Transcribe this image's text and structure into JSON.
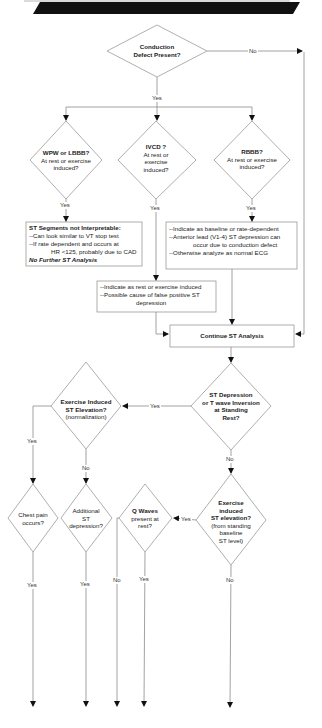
{
  "header_bar": {
    "color": "#111111"
  },
  "colors": {
    "line": "#8a8a8a",
    "arrow": "#111111",
    "shape_stroke": "#9a9a9a",
    "text": "#222222"
  },
  "nodes": {
    "conduction_defect": {
      "lines": [
        "Conduction",
        "Defect  Present?"
      ],
      "bold": true
    },
    "wpw_lbbb": {
      "title": "WPW or LBBB?",
      "sub": [
        "At rest or exercise",
        "induced?"
      ]
    },
    "ivcd": {
      "title": "IVCD ?",
      "sub": [
        "At rest or",
        "exercise",
        "induced?"
      ]
    },
    "rbbb": {
      "title": "RBBB?",
      "sub": [
        "At rest or exercise",
        "induced?"
      ]
    },
    "st_not_interpretable": {
      "title": "ST Segments not Interpretable:",
      "lines": [
        "--Can look similar to VT stop test",
        "--If rate dependent and occurs at"
      ],
      "indent_line": "HR <125, probably due to CAD",
      "footer": "No Further ST Analysis"
    },
    "rbbb_box": {
      "lines": [
        "--Indicate as baseline or rate-dependent",
        "--Anterior lead (V1-4) ST depression can"
      ],
      "indent_line": "occur due to conduction defect",
      "last_line": "--Otherwise analyze as normal ECG"
    },
    "ivcd_box": {
      "lines": [
        "--Indicate as rest or exercise induced",
        "--Possible cause of false positive ST"
      ],
      "indent_line": "depression"
    },
    "continue": {
      "label": "Continue ST Analysis"
    },
    "st_depression": {
      "lines": [
        "ST  Depression",
        "or T wave Inversion",
        "at Standing",
        "Rest?"
      ]
    },
    "exercise_st_elevation": {
      "title": [
        "Exercise Induced",
        "ST Elevation?"
      ],
      "sub": "(normalization)"
    },
    "chest_pain": {
      "lines": [
        "Chest pain",
        "occurs?"
      ]
    },
    "additional_st": {
      "lines": [
        "Additional",
        "ST",
        "depression?"
      ]
    },
    "q_waves": {
      "title": "Q Waves",
      "sub": [
        "present at",
        "rest?"
      ]
    },
    "exercise_from_standing": {
      "title": [
        "Exercise",
        "induced",
        "ST elevation?"
      ],
      "sub": [
        "(from standing",
        "baseline",
        "ST level)"
      ]
    }
  },
  "edge_labels": {
    "conduction_no": "No",
    "conduction_yes": "Yes",
    "wpw_yes": "Yes",
    "ivcd_yes": "Yes",
    "rbbb_yes": "Yes",
    "st_depression_yes": "Yes",
    "st_depression_no": "No",
    "elevation_yes": "Yes",
    "elevation_no": "No",
    "chest_pain_yes": "Yes",
    "additional_yes": "Yes",
    "q_waves_no": "No",
    "q_waves_yes": "Yes",
    "from_standing_yes": "Yes",
    "from_standing_no": "No"
  }
}
